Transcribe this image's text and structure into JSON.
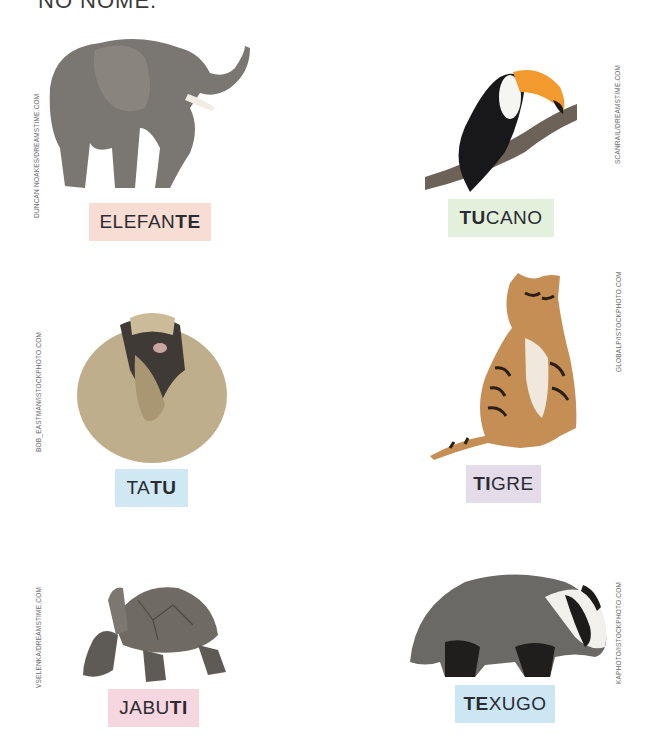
{
  "page": {
    "heading_partial": "NO NOME.",
    "colors": {
      "pink": "#f7ddd3",
      "green": "#e3f1dc",
      "blue": "#cfe8f1",
      "lavender": "#e4dce8",
      "rose": "#f6d6df",
      "sky": "#cce6f3"
    }
  },
  "animals": [
    {
      "id": "elefante",
      "name_plain": "ELEFAN",
      "name_bold": "TE",
      "bold_position": "end",
      "label_color": "pink",
      "credit": "DUNCAN NOAKES/DREAMSTIME.COM"
    },
    {
      "id": "tucano",
      "name_bold": "TU",
      "name_plain": "CANO",
      "bold_position": "start",
      "label_color": "green",
      "credit": "SCANRAIL/DREAMSTIME.COM"
    },
    {
      "id": "tatu",
      "name_plain": "TA",
      "name_bold": "TU",
      "bold_position": "end",
      "label_color": "blue",
      "credit": "BOB_EASTMAN/ISTOCKPHOTO.COM"
    },
    {
      "id": "tigre",
      "name_bold": "TI",
      "name_plain": "GRE",
      "bold_position": "start",
      "label_color": "lavender",
      "credit": "GLOBALP/ISTOCKPHOTO.COM"
    },
    {
      "id": "jabuti",
      "name_plain": "JABU",
      "name_bold": "TI",
      "bold_position": "end",
      "label_color": "rose",
      "credit": "VSELENKA/DREAMSTIME.COM"
    },
    {
      "id": "texugo",
      "name_bold": "TE",
      "name_plain": "XUGO",
      "bold_position": "start",
      "label_color": "sky",
      "credit": "KAPHOTO/ISTOCKPHOTO.COM"
    }
  ]
}
